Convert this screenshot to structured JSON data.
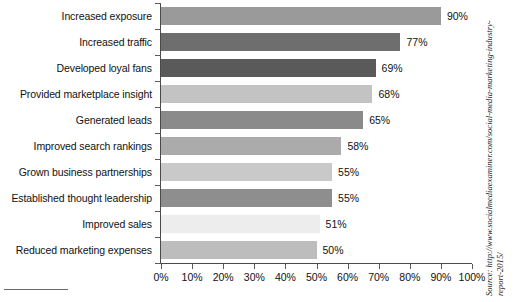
{
  "chart_data": {
    "type": "bar",
    "orientation": "horizontal",
    "title": "",
    "xlabel": "",
    "ylabel": "",
    "xlim": [
      0,
      100
    ],
    "grid": false,
    "legend": "none",
    "categories": [
      "Increased exposure",
      "Increased traffic",
      "Developed loyal fans",
      "Provided marketplace insight",
      "Generated leads",
      "Improved search rankings",
      "Grown business partnerships",
      "Established thought leadership",
      "Improved sales",
      "Reduced marketing expenses"
    ],
    "values": [
      90,
      77,
      69,
      68,
      65,
      58,
      55,
      55,
      51,
      50
    ],
    "value_labels": [
      "90%",
      "77%",
      "69%",
      "68%",
      "65%",
      "58%",
      "55%",
      "55%",
      "51%",
      "50%"
    ],
    "bar_colors": [
      "#9a9a9a",
      "#6e6e6e",
      "#5a5a5a",
      "#c3c3c3",
      "#8a8a8a",
      "#ababab",
      "#c9c9c9",
      "#8e8e8e",
      "#ededed",
      "#bdbdbd"
    ],
    "tick_labels": [
      "0%",
      "10%",
      "20%",
      "30%",
      "40%",
      "50%",
      "60%",
      "70%",
      "80%",
      "90%",
      "100%"
    ],
    "tick_values": [
      0,
      10,
      20,
      30,
      40,
      50,
      60,
      70,
      80,
      90,
      100
    ]
  },
  "source": {
    "line1": "Source: http://www.socialmediaexaminer.com/social-media-marketing-industry-",
    "line2": "report-2015/"
  }
}
